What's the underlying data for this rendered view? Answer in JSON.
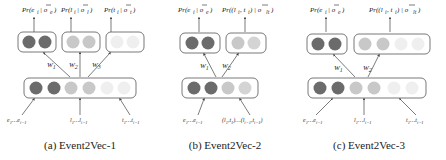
{
  "colors": {
    "dark": "#6b6b6b",
    "medium": "#c4c4c4",
    "light": "#eeeeee"
  },
  "panels": [
    {
      "id": "a",
      "caption": "(a) Event2Vec-1",
      "outputs": [
        {
          "label": "Pr(e_i | o_e)",
          "shade": "dark"
        },
        {
          "label": "Pr(l_i | o_l)",
          "shade": "medium"
        },
        {
          "label": "Pr(t_i | o_t)",
          "shade": "light"
        }
      ],
      "weights": [
        "W1",
        "W2",
        "W3"
      ],
      "input_shades": [
        "dark",
        "dark",
        "medium",
        "medium",
        "light",
        "light"
      ],
      "inputs": [
        "e1…ei-1",
        "l1…li-1",
        "t1…ti-1"
      ]
    },
    {
      "id": "b",
      "caption": "(b) Event2Vec-2",
      "outputs": [
        {
          "label": "Pr(e_i | o_e)",
          "shade": "dark"
        },
        {
          "label": "Pr((l_i, t_i) | o_lt)",
          "shade": "medium"
        }
      ],
      "weights": [
        "W1",
        "W2"
      ],
      "input_shades": [
        "dark",
        "dark",
        "medium",
        "medium"
      ],
      "inputs": [
        "e1…ei-1",
        "(l1,t1)…(li-1,ti-1)"
      ]
    },
    {
      "id": "c",
      "caption": "(c) Event2Vec-3",
      "outputs": [
        {
          "label": "Pr(e_i | o_e)",
          "shade": "dark"
        },
        {
          "label": "Pr((l_i, t_i) | o_lt)",
          "shade": "medium-light"
        }
      ],
      "weights": [
        "W1",
        "W2"
      ],
      "input_shades": [
        "dark",
        "dark",
        "medium",
        "medium",
        "light",
        "light"
      ],
      "inputs": [
        "e1…ei-1",
        "l1…li-1",
        "t1…ti-1"
      ]
    }
  ]
}
